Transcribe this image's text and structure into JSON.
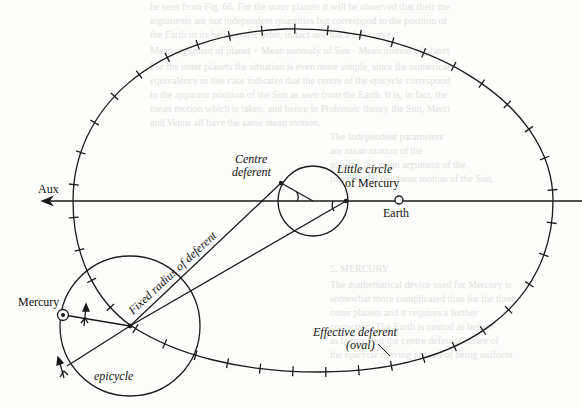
{
  "figure": {
    "labels": {
      "aux": "Aux",
      "centre_deferent_1": "Centre",
      "centre_deferent_2": "deferent",
      "little_circle_1": "Little circle",
      "little_circle_2": "of Mercury",
      "earth": "Earth",
      "mercury": "Mercury",
      "fixed_radius": "Fixed radius of deferent",
      "epicycle": "epicycle",
      "effective_deferent_1": "Effective deferent",
      "effective_deferent_2": "(oval)"
    },
    "colors": {
      "ink": "#1a1a1a",
      "paper": "#fdfdfb",
      "showthrough": "#e2e2df"
    }
  },
  "background_text": [
    "be seen from Fig. 66. For the outer planets it will be observed that their mean",
    "arguments are not independent quantities but correspond to the position of",
    "the Earth in its heliocentric orbit, in fact one has a full curve.",
    "Mean argument of planet = Mean anomaly of Sun - Mean motion of planet.",
    "For the inner planets the situation is even more simple, since the numerical",
    "equivalence in this case indicates that the centre of the epicycle corresponds",
    "to the apparent position of the Sun as seen from the Earth. It is, in fact, the",
    "mean motion which is taken, and hence in Ptolemaic theory the Sun, Mercury",
    "and Venus all have the same mean motion.",
    "The independent parameters",
    "are mean motion of the",
    "planets, the mean argument of the",
    "planets, and the mean motion of the Sun.",
    "5. MERCURY",
    "The mathematical device used for Mercury is",
    "somewhat more complicated than for the three",
    "outer planets and it requires a further",
    "correction. The Earth is central as before",
    "as before, but the centre deferent centre of",
    "the epicycle moving instead of being uniform"
  ]
}
